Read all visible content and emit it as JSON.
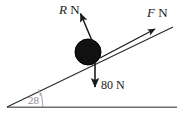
{
  "figure": {
    "kind": "free-body-diagram-inclined-plane",
    "background_color": "#ffffff",
    "ink_color": "#1a1a1a",
    "ball": {
      "name": "block-on-incline",
      "center_x": 88,
      "center_y": 52,
      "radius": 13,
      "fill_color": "#111111"
    },
    "incline": {
      "angle_value": "28",
      "degree_symbol": "°",
      "angle_label": "28°",
      "angle_label_color": "#8a8a8a",
      "apex_x": 7,
      "apex_y": 107,
      "top_x": 173,
      "top_y": 27
    },
    "baseline": {
      "name": "ground-line",
      "start_x": 7,
      "end_x": 177,
      "y": 107,
      "color": "#6f6f6f"
    },
    "forces": [
      {
        "id": "normal",
        "symbol": "R",
        "unit": "N",
        "label": "R N",
        "direction": "up-left perpendicular to incline",
        "tail_x": 93,
        "tail_y": 43,
        "head_x": 80,
        "head_y": 12
      },
      {
        "id": "applied",
        "symbol": "F",
        "unit": "N",
        "label": "F N",
        "direction": "up-right along incline",
        "tail_x": 103,
        "tail_y": 56,
        "head_x": 156,
        "head_y": 29
      },
      {
        "id": "weight",
        "symbol": "80",
        "unit": "N",
        "label": "80 N",
        "direction": "vertically downward",
        "tail_x": 95,
        "tail_y": 62,
        "head_x": 95,
        "head_y": 89
      }
    ]
  }
}
